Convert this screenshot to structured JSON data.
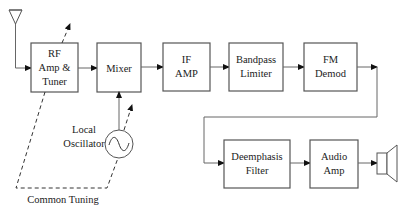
{
  "diagram": {
    "type": "block-diagram",
    "colors": {
      "stroke": "#555555",
      "text": "#222222",
      "background": "#ffffff"
    },
    "blocks": [
      {
        "id": "rf",
        "lines": [
          "RF",
          "Amp &",
          "Tuner"
        ]
      },
      {
        "id": "mixer",
        "lines": [
          "Mixer"
        ]
      },
      {
        "id": "if",
        "lines": [
          "IF",
          "AMP"
        ]
      },
      {
        "id": "bandpass",
        "lines": [
          "Bandpass",
          "Limiter"
        ]
      },
      {
        "id": "fm",
        "lines": [
          "FM",
          "Demod"
        ]
      },
      {
        "id": "deemph",
        "lines": [
          "Deemphasis",
          "Filter"
        ]
      },
      {
        "id": "audio",
        "lines": [
          "Audio",
          "Amp"
        ]
      }
    ],
    "oscillator": {
      "lines": [
        "Local",
        "Oscillator"
      ]
    },
    "common_tuning_label": "Common Tuning",
    "icons": [
      "antenna-icon",
      "sine-wave-icon",
      "speaker-icon"
    ]
  }
}
